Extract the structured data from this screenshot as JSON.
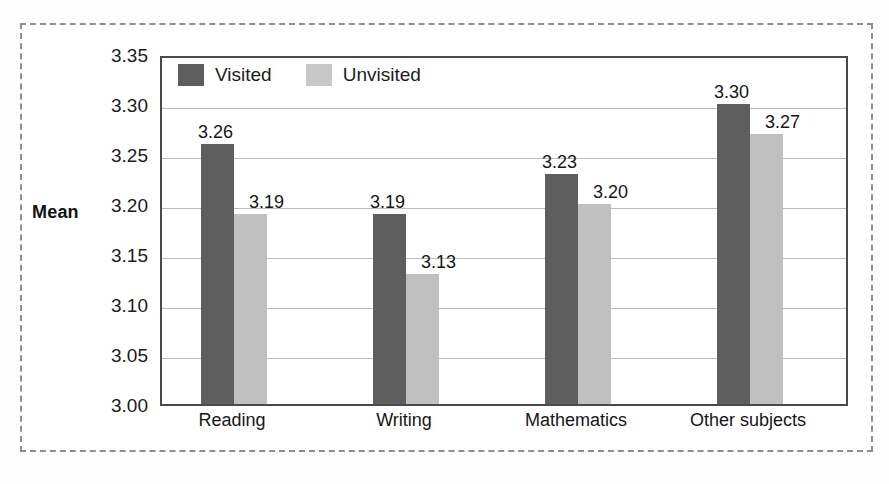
{
  "chart_data": {
    "type": "bar",
    "title": "",
    "xlabel": "",
    "ylabel": "Mean",
    "ylim": [
      3.0,
      3.35
    ],
    "ytick_step": 0.05,
    "grid": true,
    "legend_position": "top-left inside plot",
    "categories": [
      "Reading",
      "Writing",
      "Mathematics",
      "Other subjects"
    ],
    "ytick_labels": [
      "3.35",
      "3.30",
      "3.25",
      "3.20",
      "3.15",
      "3.10",
      "3.05",
      "3.00"
    ],
    "ytick_values": [
      3.35,
      3.3,
      3.25,
      3.2,
      3.15,
      3.1,
      3.05,
      3.0
    ],
    "series": [
      {
        "name": "Visited",
        "color": "#5e5e5e",
        "values": [
          3.26,
          3.19,
          3.23,
          3.3
        ],
        "labels": [
          "3.26",
          "3.19",
          "3.23",
          "3.30"
        ]
      },
      {
        "name": "Unvisited",
        "color": "#c0c0c0",
        "values": [
          3.19,
          3.13,
          3.2,
          3.27
        ],
        "labels": [
          "3.19",
          "3.13",
          "3.20",
          "3.27"
        ]
      }
    ]
  },
  "legend": {
    "items": [
      {
        "label": "Visited",
        "color": "#5e5e5e"
      },
      {
        "label": "Unvisited",
        "color": "#c7c7c7"
      }
    ]
  },
  "axis": {
    "y_title": "Mean"
  }
}
